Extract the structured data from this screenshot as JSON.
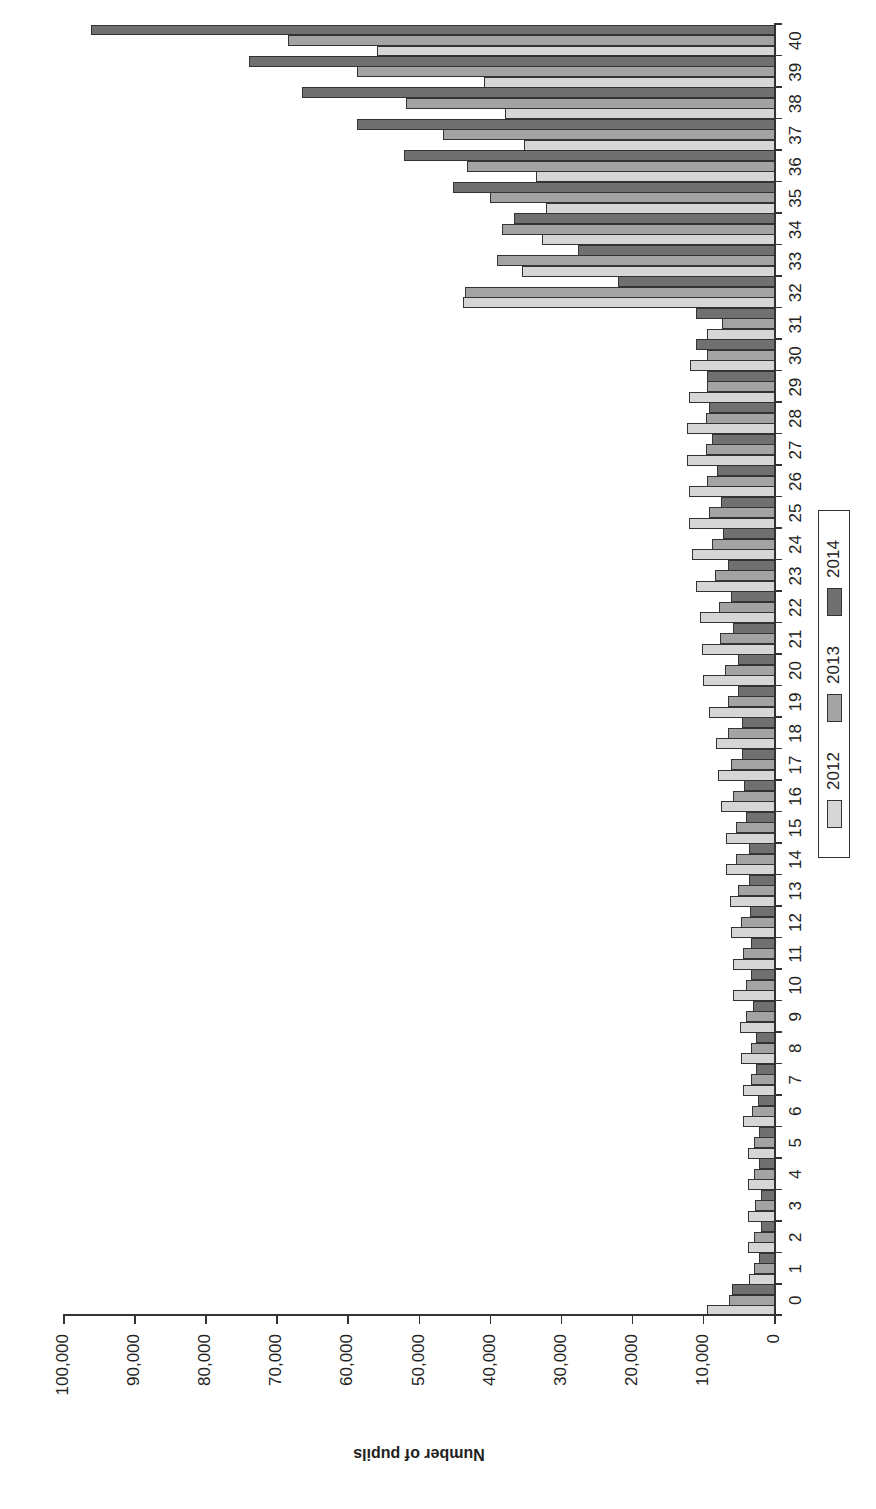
{
  "chart_data": {
    "type": "bar",
    "orientation": "rotated-90-ccw",
    "title": "",
    "xlabel": "",
    "ylabel": "Number of pupils",
    "ylim": [
      0,
      100000
    ],
    "yticks": [
      "0",
      "10,000",
      "20,000",
      "30,000",
      "40,000",
      "50,000",
      "60,000",
      "70,000",
      "80,000",
      "90,000",
      "100,000"
    ],
    "grid": false,
    "legend_position": "bottom-center",
    "categories": [
      "0",
      "1",
      "2",
      "3",
      "4",
      "5",
      "6",
      "7",
      "8",
      "9",
      "10",
      "11",
      "12",
      "13",
      "14",
      "15",
      "16",
      "17",
      "18",
      "19",
      "20",
      "21",
      "22",
      "23",
      "24",
      "25",
      "26",
      "27",
      "28",
      "29",
      "30",
      "31",
      "32",
      "33",
      "34",
      "35",
      "36",
      "37",
      "38",
      "39",
      "40"
    ],
    "series": [
      {
        "name": "2012",
        "color": "#d6d6d6",
        "values": [
          9400,
          3500,
          3600,
          3600,
          3700,
          3700,
          4300,
          4400,
          4700,
          4800,
          5700,
          5700,
          6000,
          6200,
          6700,
          6800,
          7400,
          7900,
          8200,
          9200,
          10000,
          10100,
          10400,
          11000,
          11500,
          11900,
          11900,
          12300,
          12200,
          11900,
          11800,
          9400,
          43800,
          35500,
          32700,
          32100,
          33500,
          35100,
          37900,
          40800,
          55800
        ]
      },
      {
        "name": "2013",
        "color": "#a3a3a3",
        "values": [
          6300,
          2800,
          2800,
          2700,
          2800,
          2800,
          3100,
          3300,
          3300,
          3900,
          3900,
          4300,
          4700,
          5000,
          5300,
          5400,
          5700,
          6100,
          6500,
          6500,
          6900,
          7600,
          7800,
          8300,
          8700,
          9100,
          9400,
          9600,
          9500,
          9400,
          9400,
          7300,
          43500,
          38900,
          38300,
          40000,
          43200,
          46500,
          51700,
          58700,
          68300
        ]
      },
      {
        "name": "2014",
        "color": "#707070",
        "values": [
          5900,
          2100,
          1800,
          1800,
          2100,
          2100,
          2200,
          2500,
          2500,
          2900,
          3200,
          3200,
          3400,
          3500,
          3500,
          4000,
          4200,
          4500,
          4500,
          5100,
          5100,
          5800,
          6000,
          6500,
          7200,
          7400,
          8000,
          8700,
          9100,
          9400,
          11000,
          11000,
          22000,
          27600,
          36500,
          45200,
          52000,
          58700,
          66400,
          73900,
          96000
        ]
      }
    ]
  }
}
